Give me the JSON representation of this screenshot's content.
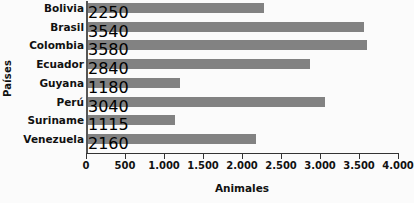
{
  "chart_data": {
    "type": "bar",
    "orientation": "horizontal",
    "title": "",
    "xlabel": "Animales",
    "ylabel": "Países",
    "categories": [
      "Bolivia",
      "Brasil",
      "Colombia",
      "Ecuador",
      "Guyana",
      "Perú",
      "Suriname",
      "Venezuela"
    ],
    "values": [
      2250,
      3540,
      3580,
      2840,
      1180,
      3040,
      1115,
      2160
    ],
    "xlim": [
      0,
      4000
    ],
    "xticks": [
      0,
      500,
      1000,
      1500,
      2000,
      2500,
      3000,
      3500,
      4000
    ],
    "xticklabels": [
      "0",
      "500",
      "1.000",
      "1.500",
      "2.000",
      "2.500",
      "3.000",
      "3.500",
      "4.000"
    ],
    "grid": false,
    "legend": false,
    "bar_color": "#828282",
    "axis_color": "#333333",
    "background_color": "#fbfbfb",
    "text_color": "#111111"
  }
}
